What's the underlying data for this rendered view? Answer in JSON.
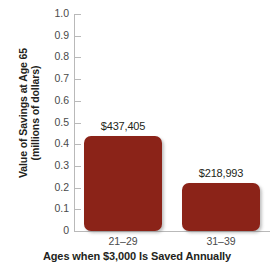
{
  "chart_data": {
    "type": "bar",
    "title": "",
    "categories": [
      "21–29",
      "31–39"
    ],
    "values": [
      0.437405,
      0.218993
    ],
    "data_labels": [
      "$437,405",
      "$218,993"
    ],
    "xlabel": "Ages when $3,000 Is Saved Annually",
    "ylabel_line1": "Value of Savings at Age 65",
    "ylabel_line2": "(millions of dollars)",
    "ylim": [
      0,
      1.0
    ],
    "ytick_labels": [
      "1.0",
      "0.9",
      "0.8",
      "0.7",
      "0.6",
      "0.5",
      "0.4",
      "0.3",
      "0.2",
      "0.1",
      "0"
    ],
    "ytick_values": [
      1.0,
      0.9,
      0.8,
      0.7,
      0.6,
      0.5,
      0.4,
      0.3,
      0.2,
      0.1,
      0
    ],
    "grid": false,
    "legend": "none",
    "bar_color": "#8b2318",
    "axis_color": "#b9b9b9",
    "background_color": "#ffffff",
    "text_color": "#231f20"
  }
}
